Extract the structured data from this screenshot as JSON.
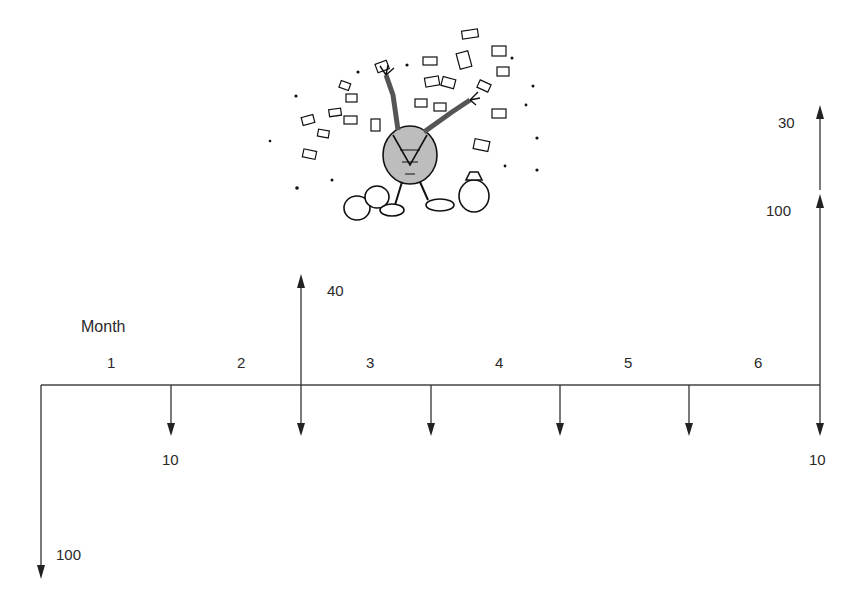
{
  "diagram": {
    "type": "cash-flow-diagram",
    "axis_label": "Month",
    "periods": [
      "1",
      "2",
      "3",
      "4",
      "5",
      "6"
    ],
    "cash_flows": [
      {
        "period_end": 0,
        "direction": "out",
        "amount": "100"
      },
      {
        "period_end": 1,
        "direction": "out",
        "amount": "10"
      },
      {
        "period_end": 2,
        "direction": "out",
        "amount": ""
      },
      {
        "period_end": 2,
        "direction": "in",
        "amount": "40"
      },
      {
        "period_end": 3,
        "direction": "out",
        "amount": ""
      },
      {
        "period_end": 4,
        "direction": "out",
        "amount": ""
      },
      {
        "period_end": 5,
        "direction": "out",
        "amount": ""
      },
      {
        "period_end": 6,
        "direction": "out",
        "amount": "10"
      },
      {
        "period_end": 6,
        "direction": "in",
        "amount": "100"
      },
      {
        "period_end": 6,
        "direction": "in",
        "amount": "30"
      }
    ],
    "labels": {
      "month": "Month",
      "p1": "1",
      "p2": "2",
      "p3": "3",
      "p4": "4",
      "p5": "5",
      "p6": "6",
      "out_initial": "100",
      "out_month1": "10",
      "in_month2": "40",
      "out_month6": "10",
      "in_month6_a": "100",
      "in_month6_b": "30"
    },
    "illustration": "cartoon-character-tossing-money"
  }
}
